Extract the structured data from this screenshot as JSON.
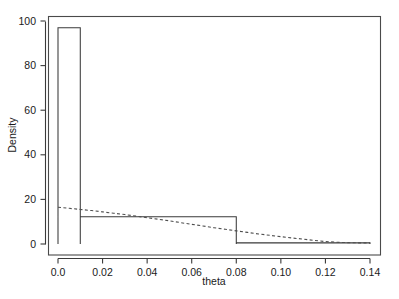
{
  "figure": {
    "background_color": "#ffffff",
    "line_color": "#3a3a3a",
    "width": 399,
    "height": 299
  },
  "axes": {
    "x_title": "theta",
    "y_title": "Density",
    "x_ticks": [
      "0.0",
      "0.02",
      "0.04",
      "0.06",
      "0.08",
      "0.10",
      "0.12",
      "0.14"
    ],
    "y_ticks": [
      "0",
      "20",
      "40",
      "60",
      "80",
      "100"
    ]
  },
  "chart_data": {
    "type": "bar",
    "title": "",
    "subtitle": "",
    "xlabel": "theta",
    "ylabel": "Density",
    "xlim": [
      -0.004,
      0.1455
    ],
    "ylim": [
      -2.5,
      104
    ],
    "xticks": [
      0.0,
      0.02,
      0.04,
      0.06,
      0.08,
      0.1,
      0.12,
      0.14
    ],
    "xticklabels": [
      "0.0",
      "0.02",
      "0.04",
      "0.06",
      "0.08",
      "0.10",
      "0.12",
      "0.14"
    ],
    "yticks": [
      0,
      20,
      40,
      60,
      80,
      100
    ],
    "yticklabels": [
      "0",
      "20",
      "40",
      "60",
      "80",
      "100"
    ],
    "grid": false,
    "legend": null,
    "histogram": {
      "style": "step-outline",
      "bin_edges": [
        0.0,
        0.01,
        0.08,
        0.14
      ],
      "densities": [
        97.0,
        12.2,
        0.5
      ]
    },
    "series": [
      {
        "name": "fitted density",
        "type": "line",
        "linestyle": "dashed",
        "x": [
          0.0,
          0.005,
          0.01,
          0.015,
          0.02,
          0.025,
          0.03,
          0.035,
          0.04,
          0.045,
          0.05,
          0.055,
          0.06,
          0.065,
          0.07,
          0.075,
          0.08,
          0.085,
          0.09,
          0.095,
          0.1,
          0.105,
          0.11,
          0.115,
          0.12,
          0.125,
          0.13,
          0.135,
          0.14
        ],
        "values": [
          16.5,
          16.0,
          15.5,
          15.0,
          14.4,
          13.8,
          13.2,
          12.5,
          11.8,
          11.1,
          10.4,
          9.6,
          8.8,
          8.1,
          7.3,
          6.6,
          5.9,
          5.2,
          4.5,
          3.9,
          3.3,
          2.7,
          2.2,
          1.6,
          1.1,
          0.8,
          0.6,
          0.5,
          0.5
        ]
      }
    ]
  }
}
